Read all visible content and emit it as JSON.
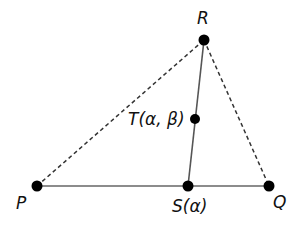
{
  "diagram": {
    "points": {
      "R": {
        "label": "R",
        "x": 204,
        "y": 40
      },
      "T": {
        "label": "T(α, β)",
        "x": 195,
        "y": 119
      },
      "P": {
        "label": "P",
        "x": 37,
        "y": 186
      },
      "S": {
        "label": "S(α)",
        "x": 188,
        "y": 186
      },
      "Q": {
        "label": "Q",
        "x": 269,
        "y": 186
      }
    },
    "segments": [
      {
        "from": "P",
        "to": "Q",
        "style": "solid"
      },
      {
        "from": "R",
        "to": "S",
        "style": "solid"
      },
      {
        "from": "P",
        "to": "R",
        "style": "dashed"
      },
      {
        "from": "R",
        "to": "Q",
        "style": "dashed"
      }
    ],
    "colors": {
      "line": "#555555",
      "dot": "#000000",
      "text": "#111111"
    }
  }
}
